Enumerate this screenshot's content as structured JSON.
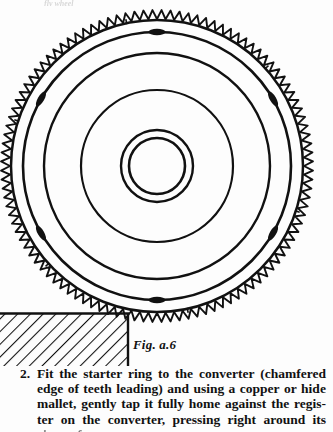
{
  "page": {
    "bleed_text": "fly wheel",
    "background_color": "#ffffff",
    "ink_color": "#111111"
  },
  "figure": {
    "name": "starter-ring-on-converter",
    "caption": "Fig. a.6",
    "geometry": {
      "center_x": 157,
      "center_y": 166,
      "tooth_outer_radius": 156,
      "tooth_root_radius": 147,
      "ring_outer_radius": 146,
      "ring_inner_radius": 134,
      "disc_radius": 113,
      "mid_ring_radius": 76,
      "hub_outer_radius": 36,
      "hub_inner_radius": 28,
      "tooth_count": 108,
      "bolt_marks": 6,
      "bolt_mark_angles_deg": [
        270,
        330,
        30,
        90,
        150,
        210
      ]
    },
    "support_block": {
      "name": "hatched-support-block",
      "x": 0,
      "y": 313,
      "width": 129,
      "height": 57,
      "hatch_angle_deg": 45
    }
  },
  "instructions": {
    "number": "2.",
    "lines": [
      "Fit the starter ring to the converter (chamfered",
      "edge of teeth leading) and using a copper or hide",
      "mallet, gently tap it fully home against the regis-",
      "ter on the converter, pressing right around its",
      "circumference"
    ],
    "full_text": "2. Fit the starter ring to the converter (chamfered edge of teeth leading) and using a copper or hide mallet, gently tap it fully home against the register on the converter, pressing right around its circumference"
  }
}
